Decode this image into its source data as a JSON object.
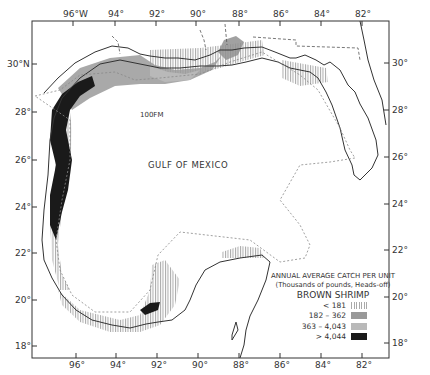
{
  "map": {
    "title_label": "GULF OF MEXICO",
    "contour_label": "100FM",
    "top_longitudes": [
      "96°W",
      "94°",
      "92°",
      "90°",
      "88°",
      "86°",
      "84°",
      "82°"
    ],
    "bottom_longitudes": [
      "96°",
      "94°",
      "92°",
      "90°",
      "88°",
      "86°",
      "84°",
      "82°"
    ],
    "left_latitudes": [
      "30°N",
      "28°",
      "26°",
      "24°",
      "22°",
      "20°",
      "18°"
    ],
    "right_latitudes": [
      "30°",
      "28°",
      "26°",
      "24°",
      "22°",
      "20°",
      "18°"
    ]
  },
  "legend": {
    "title_line1": "ANNUAL AVERAGE CATCH PER UNIT",
    "title_line2": "(Thousands of pounds, Heads-off)",
    "species": "BROWN SHRIMP",
    "classes": [
      {
        "label": "< 181",
        "style": "vertical-hatch"
      },
      {
        "label": "182 – 362",
        "style": "medium-gray"
      },
      {
        "label": "363 – 4,043",
        "style": "light-gray-stipple"
      },
      {
        "label": "> 4,044",
        "style": "black"
      }
    ]
  },
  "colors": {
    "frame": "#333333",
    "dark_fill": "#1a1a1a",
    "medium_fill": "#999999",
    "light_fill": "#b9b9b9",
    "hatch": "#aaaaaa"
  }
}
